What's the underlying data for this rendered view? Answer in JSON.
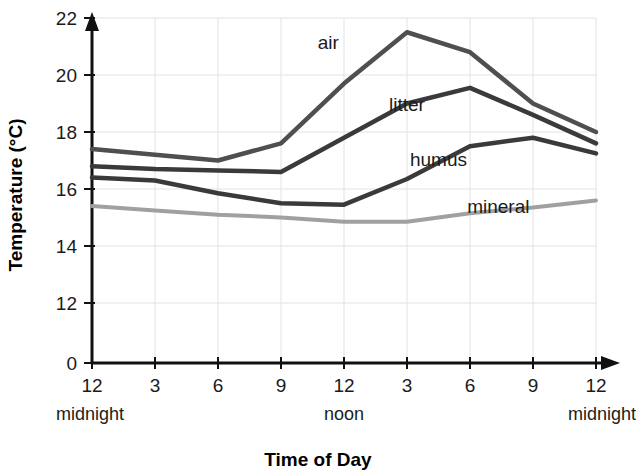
{
  "chart_data": {
    "type": "line",
    "title": "",
    "xlabel": "Time of Day",
    "ylabel": "Temperature (°C)",
    "grid": true,
    "legend_position": "inline-labels",
    "x": [
      "12",
      "3",
      "6",
      "9",
      "12",
      "3",
      "6",
      "9",
      "12"
    ],
    "x_tick_labels": [
      "12",
      "3",
      "6",
      "9",
      "12",
      "3",
      "6",
      "9",
      "12"
    ],
    "x_daypart_labels": [
      {
        "text": "midnight",
        "at_index": 0
      },
      {
        "text": "noon",
        "at_index": 4
      },
      {
        "text": "midnight",
        "at_index": 8
      }
    ],
    "y_tick_labels": [
      "0",
      "12",
      "14",
      "16",
      "18",
      "20",
      "22"
    ],
    "y_tick_values": [
      0,
      12,
      14,
      16,
      18,
      20,
      22
    ],
    "ylim": [
      12,
      22
    ],
    "y_axis_has_break": true,
    "series": [
      {
        "name": "air",
        "color": "#4f4f4f",
        "width": 4.5,
        "values": [
          17.4,
          17.2,
          17.0,
          17.6,
          19.7,
          21.5,
          20.8,
          19.0,
          18.0
        ],
        "label_pos": {
          "x_index": 3.75,
          "y_value": 20.9
        }
      },
      {
        "name": "litter",
        "color": "#3a3a3a",
        "width": 4.5,
        "values": [
          16.8,
          16.7,
          16.65,
          16.6,
          17.8,
          19.0,
          19.55,
          18.6,
          17.6
        ],
        "label_pos": {
          "x_index": 5.0,
          "y_value": 18.75
        }
      },
      {
        "name": "humus",
        "color": "#3a3a3a",
        "width": 4.5,
        "values": [
          16.4,
          16.3,
          15.85,
          15.5,
          15.45,
          16.35,
          17.5,
          17.8,
          17.25
        ],
        "label_pos": {
          "x_index": 5.5,
          "y_value": 16.8
        }
      },
      {
        "name": "mineral",
        "color": "#a0a0a0",
        "width": 4.0,
        "values": [
          15.4,
          15.25,
          15.1,
          15.0,
          14.85,
          14.85,
          15.15,
          15.35,
          15.6
        ],
        "label_pos": {
          "x_index": 6.45,
          "y_value": 15.15
        }
      }
    ]
  },
  "axes": {
    "x_title": "Time of Day",
    "y_title": "Temperature (°C)"
  }
}
